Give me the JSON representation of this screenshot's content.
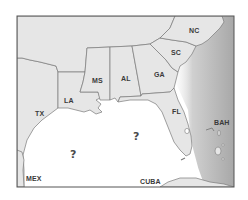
{
  "map": {
    "type": "regional map",
    "region": "Southeastern United States and Gulf of Mexico",
    "colors": {
      "land": "#e6e6e6",
      "water": "#ffffff",
      "border": "#7a7a7a",
      "atlantic_shading": "#9a9a9a",
      "frame": "#555555"
    },
    "state_labels": [
      {
        "id": "tx",
        "text": "TX"
      },
      {
        "id": "la",
        "text": "LA"
      },
      {
        "id": "ms",
        "text": "MS"
      },
      {
        "id": "al",
        "text": "AL"
      },
      {
        "id": "ga",
        "text": "GA"
      },
      {
        "id": "sc",
        "text": "SC"
      },
      {
        "id": "nc",
        "text": "NC"
      },
      {
        "id": "fl",
        "text": "FL"
      }
    ],
    "country_labels": [
      {
        "id": "mex",
        "text": "MEX"
      },
      {
        "id": "cuba",
        "text": "CUBA"
      },
      {
        "id": "bah",
        "text": "BAH"
      }
    ],
    "unknown_markers": [
      {
        "id": "q1",
        "text": "?"
      },
      {
        "id": "q2",
        "text": "?"
      }
    ]
  }
}
